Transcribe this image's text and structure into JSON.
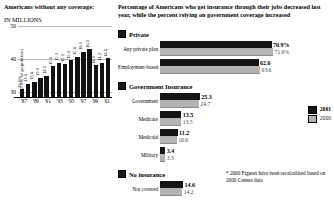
{
  "left": {
    "title": "Americans without any coverage:",
    "subtitle": "IN MILLIONS",
    "axis_label": "12.9% of population",
    "yticks": [
      "50",
      "40",
      "30"
    ],
    "xticks": [
      "'87",
      "'89",
      "'91",
      "'93",
      "'95",
      "'97",
      "'99",
      "'01"
    ]
  },
  "right": {
    "title": "Percentage of Americans who get insurance through their jobs decreased last year, while the percent relying on government coverage increased",
    "groups": [
      {
        "name": "Private",
        "rows": [
          {
            "label": "Any private plan",
            "v2001": "70.9%",
            "v2000": "71.9%",
            "p2001": 70.9,
            "p2000": 71.9
          },
          {
            "label": "Employment-based",
            "v2001": "62.6",
            "v2000": "63.6",
            "p2001": 62.6,
            "p2000": 63.6
          }
        ]
      },
      {
        "name": "Government Insurance",
        "rows": [
          {
            "label": "Government",
            "v2001": "25.3",
            "v2000": "24.7",
            "p2001": 25.3,
            "p2000": 24.7
          },
          {
            "label": "Medicare",
            "v2001": "13.5",
            "v2000": "13.5",
            "p2001": 13.5,
            "p2000": 13.5
          },
          {
            "label": "Medicaid",
            "v2001": "11.2",
            "v2000": "10.6",
            "p2001": 11.2,
            "p2000": 10.6
          },
          {
            "label": "Military",
            "v2001": "3.4",
            "v2000": "3.3",
            "p2001": 3.4,
            "p2000": 3.3
          }
        ]
      },
      {
        "name": "No insurance",
        "rows": [
          {
            "label": "Not covered",
            "v2001": "14.6",
            "v2000": "14.2",
            "p2001": 14.6,
            "p2000": 14.2
          }
        ]
      }
    ],
    "legend": {
      "series1": "2001",
      "series2": "2000"
    },
    "footnote": "* 2000 Figures have been recalculated based on 2000 Census data"
  },
  "chart_data": [
    {
      "type": "bar",
      "title": "Americans without any coverage: IN MILLIONS",
      "xlabel": "",
      "ylabel": "Millions",
      "ylim": [
        28,
        52
      ],
      "grid": true,
      "categories": [
        "'87",
        "'88",
        "'89",
        "'90",
        "'91",
        "'92",
        "'93",
        "'94",
        "'95",
        "'96",
        "'97",
        "'98",
        "'99",
        "'00",
        "'01"
      ],
      "values": [
        31.0,
        32.7,
        33.4,
        34.7,
        35.4,
        38.6,
        39.7,
        39.4,
        40.6,
        41.7,
        43.4,
        44.3,
        39.0,
        39.8,
        41.2
      ],
      "data_labels": [
        "12.9%",
        "13.4",
        "13.6",
        "13.9",
        "14.1",
        "15.0",
        "15.3",
        "15.2",
        "15.4",
        "15.6",
        "16.1",
        "16.1",
        "14.1",
        "14.2",
        "14.6"
      ],
      "yticks": [
        30,
        40,
        50
      ],
      "annotation": "12.9% of population"
    },
    {
      "type": "bar",
      "orientation": "horizontal",
      "title": "Percentage of Americans who get insurance through their jobs decreased last year, while the percent relying on government coverage increased",
      "xlabel": "Percent",
      "ylabel": "",
      "xlim": [
        0,
        75
      ],
      "legend_position": "right",
      "categories": [
        "Any private plan",
        "Employment-based",
        "Government",
        "Medicare",
        "Medicaid",
        "Military",
        "Not covered"
      ],
      "series": [
        {
          "name": "2001",
          "values": [
            70.9,
            62.6,
            25.3,
            13.5,
            11.2,
            3.4,
            14.6
          ]
        },
        {
          "name": "2000",
          "values": [
            71.9,
            63.6,
            24.7,
            13.5,
            10.6,
            3.3,
            14.2
          ]
        }
      ],
      "annotations": [
        "* 2000 Figures have been recalculated based on 2000 Census data"
      ]
    }
  ]
}
